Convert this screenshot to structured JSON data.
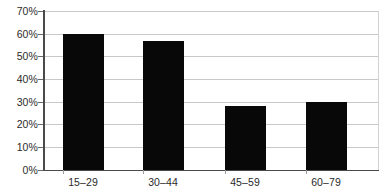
{
  "chart_data": {
    "type": "bar",
    "title": "",
    "subtitle": "",
    "xlabel": "",
    "ylabel": "",
    "categories": [
      "15–29",
      "30–44",
      "45–59",
      "60–79"
    ],
    "values": [
      60,
      57,
      28,
      30
    ],
    "ylim": [
      0,
      70
    ],
    "ytick_labels": [
      "0%",
      "10%",
      "20%",
      "30%",
      "40%",
      "50%",
      "60%",
      "70%"
    ],
    "ytick_values": [
      0,
      10,
      20,
      30,
      40,
      50,
      60,
      70
    ],
    "grid": true,
    "legend": null,
    "series": [
      {
        "name": "",
        "values": [
          60,
          57,
          28,
          30
        ],
        "color": "#080808"
      }
    ],
    "colors": {
      "bar": "#080808",
      "gridline": "#c8c8c8",
      "axis": "#4a4a4a",
      "background": "#ffffff",
      "text": "#2b2b2b"
    }
  }
}
